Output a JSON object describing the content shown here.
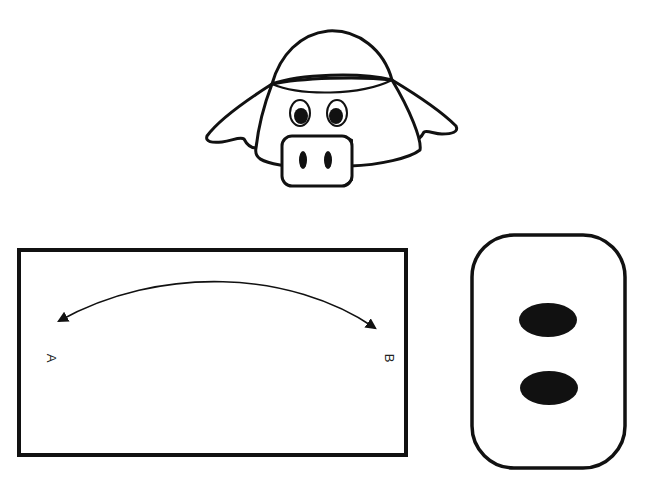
{
  "parts": {
    "pig_head": {
      "description": "Assembled pig hat preview"
    },
    "headband": {
      "label_a": "A",
      "label_b": "B",
      "instruction": "Curve band from A to B"
    },
    "snout": {
      "description": "Snout piece with two nostrils"
    }
  },
  "colors": {
    "ink": "#111111",
    "paper": "#ffffff"
  }
}
